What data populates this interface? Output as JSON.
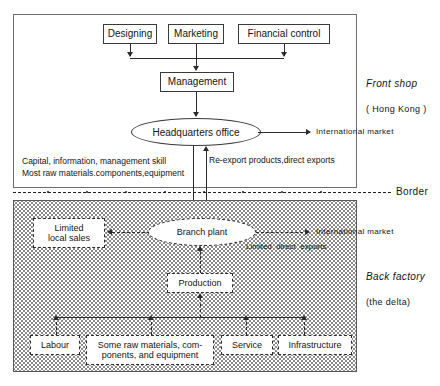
{
  "diagram": {
    "top_region": {
      "label_primary": "Front shop",
      "label_secondary": "( Hong Kong )",
      "boxes": [
        {
          "id": "designing",
          "label": "Designing"
        },
        {
          "id": "marketing",
          "label": "Marketing"
        },
        {
          "id": "financial-control",
          "label": "Financial control"
        },
        {
          "id": "management",
          "label": "Management"
        }
      ],
      "ellipse": {
        "id": "headquarters-office",
        "label": "Headquarters office"
      },
      "outputs": [
        {
          "id": "international-market-top",
          "label": "International market"
        }
      ],
      "flow_labels": [
        {
          "id": "capital-flow",
          "line1": "Capital, information, management skill",
          "line2": "Most raw materials.components,equipment"
        },
        {
          "id": "re-export-flow",
          "label": "Re-export products,direct exports"
        }
      ]
    },
    "border": {
      "label": "Border"
    },
    "bottom_region": {
      "label_primary": "Back factory",
      "label_secondary": "(the delta)",
      "ellipse": {
        "id": "branch-plant",
        "label": "Branch plant"
      },
      "boxes": [
        {
          "id": "limited-local-sales",
          "line1": "Limited",
          "line2": "local sales"
        },
        {
          "id": "production",
          "label": "Production"
        },
        {
          "id": "labour",
          "label": "Labour"
        },
        {
          "id": "raw-materials",
          "line1": "Some raw materials, com-",
          "line2": "ponents, and equipment"
        },
        {
          "id": "service",
          "label": "Service"
        },
        {
          "id": "infrastructure",
          "label": "Infrastructure"
        }
      ],
      "outputs": [
        {
          "id": "international-market-bottom",
          "label": "International market"
        }
      ],
      "flow_labels": [
        {
          "id": "limited-direct-exports",
          "label": "Limited  direct  exports"
        }
      ]
    },
    "colors": {
      "stroke": "#2b2b2b",
      "frame": "#6e6e6e",
      "shade_dot": "#8d8d8d",
      "background": "#ffffff"
    }
  }
}
